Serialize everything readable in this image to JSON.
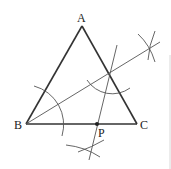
{
  "diagram": {
    "colors": {
      "lines": "#333333",
      "construction": "#555555",
      "background": "#ffffff"
    },
    "points": {
      "A": {
        "label": "A",
        "x": 82,
        "y": 26
      },
      "B": {
        "label": "B",
        "x": 26,
        "y": 124
      },
      "C": {
        "label": "C",
        "x": 137,
        "y": 124
      },
      "P": {
        "label": "P",
        "x": 97,
        "y": 124
      }
    },
    "segments": [
      {
        "name": "AB",
        "from": "A",
        "to": "B"
      },
      {
        "name": "AC",
        "from": "A",
        "to": "C"
      },
      {
        "name": "BC",
        "from": "B",
        "to": "C"
      }
    ],
    "construction_lines": [
      {
        "name": "bisector-of-angle-B",
        "from": [
          26,
          124
        ],
        "to": [
          160,
          42
        ]
      },
      {
        "name": "perpendicular-through-P",
        "from": [
          117,
          45
        ],
        "to": [
          89,
          160
        ]
      }
    ],
    "labels": {
      "A": "A",
      "B": "B",
      "C": "C",
      "P": "P"
    }
  }
}
